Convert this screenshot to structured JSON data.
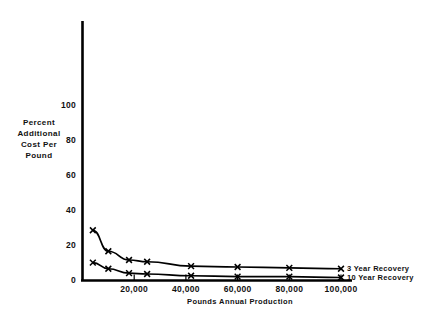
{
  "chart_data": {
    "type": "line",
    "title": "",
    "subtitle": "",
    "xlabel": "Pounds Annual Production",
    "ylabel": "Percent Additional Cost Per Pound",
    "ylabel_lines": [
      "Percent",
      "Additional",
      "Cost Per",
      "Pound"
    ],
    "xlim": [
      0,
      110000
    ],
    "ylim": [
      0,
      115
    ],
    "grid": false,
    "legend_position": "right-inline",
    "y_ticks": [
      0,
      20,
      40,
      60,
      80,
      100
    ],
    "y_tick_labels": [
      "0",
      "20",
      "40",
      "60",
      "80",
      "100"
    ],
    "x_ticks": [
      20000,
      40000,
      60000,
      80000,
      100000
    ],
    "x_tick_labels": [
      "20,000",
      "40,000",
      "60,000",
      "80,000",
      "100,000"
    ],
    "marker": "x",
    "series": [
      {
        "name": "3 Year Recovery",
        "x": [
          4000,
          10000,
          18000,
          25000,
          42000,
          60000,
          80000,
          100000
        ],
        "values": [
          29,
          17,
          12,
          11,
          8.5,
          8,
          7.5,
          7
        ]
      },
      {
        "name": "10 Year Recovery",
        "x": [
          4000,
          10000,
          18000,
          25000,
          42000,
          60000,
          80000,
          100000
        ],
        "values": [
          10.5,
          7,
          4.5,
          4,
          3,
          2.5,
          2.5,
          2
        ]
      }
    ],
    "annotations": [
      {
        "text": "3 Year Recovery",
        "series": "3 Year Recovery"
      },
      {
        "text": "10 Year Recovery",
        "series": "10 Year Recovery"
      }
    ],
    "colors": {
      "line": "#000000",
      "axis": "#000000",
      "text": "#111111",
      "background": "#ffffff"
    }
  }
}
